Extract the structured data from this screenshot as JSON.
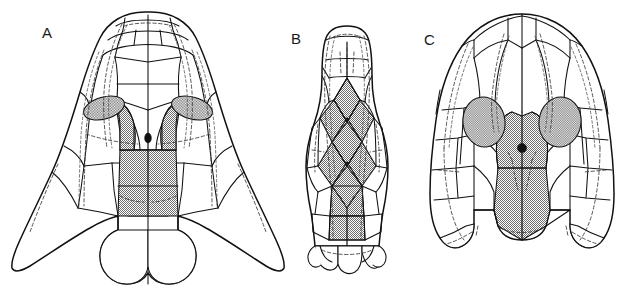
{
  "figure": {
    "background_color": "#ffffff",
    "line_color": "#111111",
    "shade_fill_color": "#9a9a9a",
    "canal_color": "#3a3a3a",
    "width": 632,
    "height": 296
  },
  "panels": [
    {
      "label": "A",
      "label_x": 42,
      "label_y": 31,
      "view": "dorsal skull roof",
      "outline_shape": "broad triangular with long pointed posterolateral tabular horns",
      "features": {
        "shaded_median_region": "parietal / postparietal shield",
        "shaded_orbits": 2,
        "orbit_shape": "elongate oblique ellipse",
        "pineal_foramen": true,
        "posterior_lobes": 3,
        "sensory_canal_lines": "paired dashed supraorbital and infraorbital canals"
      }
    },
    {
      "label": "B",
      "label_x": 291,
      "label_y": 38,
      "view": "elongate dorsal skull roof",
      "outline_shape": "narrow elongate parallel-sided with rounded anterior margin",
      "features": {
        "shaded_median_region": "column of diamond-shaped median plates",
        "shaded_orbits": 0,
        "orbit_shape": "none visible",
        "pineal_foramen": false,
        "posterior_lobes": 4,
        "sensory_canal_lines": "long paired dashed canals running full length"
      }
    },
    {
      "label": "C",
      "label_x": 424,
      "label_y": 39,
      "view": "dorsal skull roof",
      "outline_shape": "broad rounded parabolic with short posterolateral tabular projections",
      "features": {
        "shaded_median_region": "parietal and postparietal shield",
        "shaded_orbits": 2,
        "orbit_shape": "large rounded oval",
        "pineal_foramen": true,
        "posterior_lobes": 2,
        "sensory_canal_lines": "dashed supraorbital canals and short lateral segments"
      }
    }
  ]
}
